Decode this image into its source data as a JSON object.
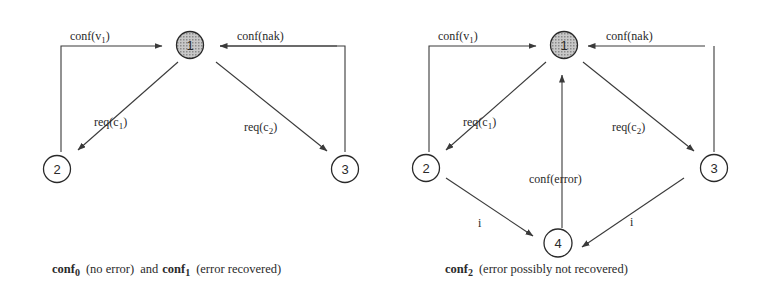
{
  "figure": {
    "left": {
      "caption": {
        "conf0": "conf",
        "conf0_sub": "0",
        "conf0_text": "(no error)",
        "and": "and",
        "conf1": "conf",
        "conf1_sub": "1",
        "conf1_text": "(error recovered)"
      },
      "nodes": [
        {
          "id": "1",
          "label": "1",
          "shaded": true
        },
        {
          "id": "2",
          "label": "2",
          "shaded": false
        },
        {
          "id": "3",
          "label": "3",
          "shaded": false
        }
      ],
      "edges": [
        {
          "from": "2",
          "to": "1",
          "label": "conf(v",
          "sub": "1",
          "close": ")"
        },
        {
          "from": "3",
          "to": "1",
          "label": "conf(nak)"
        },
        {
          "from": "1",
          "to": "2",
          "label": "req(c",
          "sub": "1",
          "close": ")"
        },
        {
          "from": "1",
          "to": "3",
          "label": "req(c",
          "sub": "2",
          "close": ")"
        }
      ]
    },
    "right": {
      "caption": {
        "conf2": "conf",
        "conf2_sub": "2",
        "conf2_text": "(error possibly not recovered)"
      },
      "nodes": [
        {
          "id": "1",
          "label": "1",
          "shaded": true
        },
        {
          "id": "2",
          "label": "2",
          "shaded": false
        },
        {
          "id": "3",
          "label": "3",
          "shaded": false
        },
        {
          "id": "4",
          "label": "4",
          "shaded": false
        }
      ],
      "edges": [
        {
          "from": "2",
          "to": "1",
          "label": "conf(v",
          "sub": "1",
          "close": ")"
        },
        {
          "from": "3",
          "to": "1",
          "label": "conf(nak)"
        },
        {
          "from": "1",
          "to": "2",
          "label": "req(c",
          "sub": "1",
          "close": ")"
        },
        {
          "from": "1",
          "to": "3",
          "label": "req(c",
          "sub": "2",
          "close": ")"
        },
        {
          "from": "4",
          "to": "1",
          "label": "conf(error)"
        },
        {
          "from": "2",
          "to": "4",
          "label": "i"
        },
        {
          "from": "3",
          "to": "4",
          "label": "i"
        }
      ]
    }
  }
}
